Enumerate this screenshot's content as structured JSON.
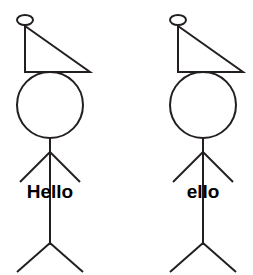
{
  "canvas": {
    "width": 253,
    "height": 275,
    "background_color": "#ffffff",
    "stroke_color": "#231f20",
    "text_color": "#000000",
    "stroke_width": 2
  },
  "figures": [
    {
      "id": "left-figure",
      "label": "Hello",
      "label_x": 50,
      "label_y": 198,
      "hat_knob": {
        "cx": 25,
        "cy": 20,
        "rx": 8,
        "ry": 5
      },
      "hat_triangle": {
        "apex_x": 25,
        "apex_y": 26,
        "base_left_x": 25,
        "base_left_y": 72,
        "base_right_x": 90,
        "base_right_y": 72
      },
      "head": {
        "cx": 50,
        "cy": 105,
        "r": 33
      },
      "body": {
        "x": 50,
        "y_top": 138,
        "y_bottom": 245
      },
      "arms": {
        "origin_x": 50,
        "origin_y": 152,
        "left_x": 20,
        "left_y": 182,
        "right_x": 80,
        "right_y": 182
      },
      "legs": {
        "origin_x": 50,
        "origin_y": 243,
        "left_x": 17,
        "left_y": 272,
        "right_x": 83,
        "right_y": 272
      }
    },
    {
      "id": "right-figure",
      "label": "ello",
      "label_x": 203,
      "label_y": 198,
      "hat_knob": {
        "cx": 178,
        "cy": 20,
        "rx": 8,
        "ry": 5
      },
      "hat_triangle": {
        "apex_x": 178,
        "apex_y": 26,
        "base_left_x": 178,
        "base_left_y": 72,
        "base_right_x": 243,
        "base_right_y": 72
      },
      "head": {
        "cx": 203,
        "cy": 105,
        "r": 33
      },
      "body": {
        "x": 203,
        "y_top": 138,
        "y_bottom": 245
      },
      "arms": {
        "origin_x": 203,
        "origin_y": 152,
        "left_x": 173,
        "left_y": 182,
        "right_x": 233,
        "right_y": 182
      },
      "legs": {
        "origin_x": 203,
        "origin_y": 243,
        "left_x": 170,
        "left_y": 272,
        "right_x": 236,
        "right_y": 272
      }
    }
  ],
  "icons": {
    "stick-figure": "stick-figure-icon",
    "triangle-hat": "triangle-hat-icon",
    "knob": "hat-knob-icon"
  }
}
